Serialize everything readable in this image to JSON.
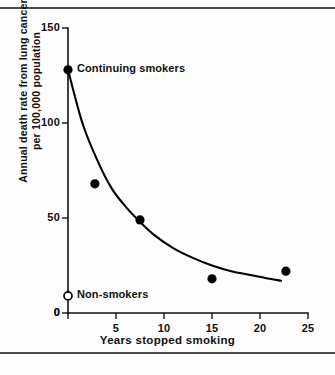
{
  "figure": {
    "background": "#fdfdfd",
    "ink_color": "#000000",
    "rule_color": "#4a4a4a"
  },
  "chart_data": {
    "type": "scatter",
    "title": "",
    "xlabel": "Years stopped smoking",
    "ylabel_lines": [
      "Annual death rate from lung cancer",
      "per 100,000 population"
    ],
    "ylabel": "Annual death rate from lung cancer per 100,000 population",
    "xlim": [
      0,
      25
    ],
    "ylim": [
      0,
      150
    ],
    "xticks": [
      0,
      5,
      10,
      15,
      20,
      25
    ],
    "xtick_labels": [
      "0",
      "5",
      "10",
      "15",
      "20",
      "25"
    ],
    "yticks": [
      0,
      50,
      100,
      150
    ],
    "ytick_labels": [
      "0",
      "50",
      "100",
      "150"
    ],
    "grid": false,
    "legend": "none",
    "series": [
      {
        "name": "Ex-smokers by years stopped",
        "marker": "filled-circle",
        "points": [
          {
            "x": 0.0,
            "y": 128
          },
          {
            "x": 2.8,
            "y": 68
          },
          {
            "x": 7.5,
            "y": 49
          },
          {
            "x": 15.0,
            "y": 18
          },
          {
            "x": 22.7,
            "y": 22
          }
        ]
      },
      {
        "name": "Non-smokers",
        "marker": "open-circle",
        "points": [
          {
            "x": 0.0,
            "y": 9
          }
        ]
      }
    ],
    "fit_curve": {
      "name": "Fitted decay curve",
      "points": [
        {
          "x": 0.0,
          "y": 128
        },
        {
          "x": 1.5,
          "y": 100
        },
        {
          "x": 3.0,
          "y": 81
        },
        {
          "x": 4.5,
          "y": 66
        },
        {
          "x": 6.0,
          "y": 56
        },
        {
          "x": 7.5,
          "y": 48
        },
        {
          "x": 9.0,
          "y": 41
        },
        {
          "x": 11.0,
          "y": 34
        },
        {
          "x": 13.0,
          "y": 29
        },
        {
          "x": 15.0,
          "y": 25
        },
        {
          "x": 17.0,
          "y": 22
        },
        {
          "x": 19.0,
          "y": 20
        },
        {
          "x": 21.0,
          "y": 18
        },
        {
          "x": 22.2,
          "y": 17
        }
      ]
    },
    "annotations": [
      {
        "name": "continuing-smokers",
        "text": "Continuing smokers",
        "x": 0.0,
        "y": 128
      },
      {
        "name": "non-smokers",
        "text": "Non-smokers",
        "x": 0.0,
        "y": 9
      }
    ]
  }
}
